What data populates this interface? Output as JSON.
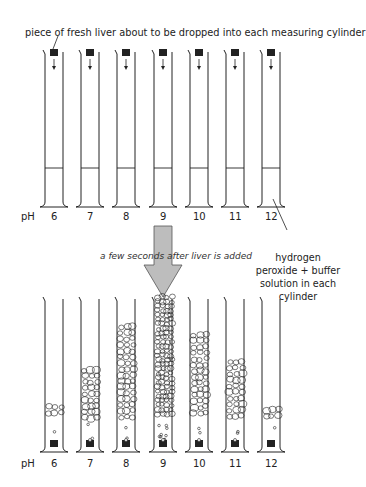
{
  "title": "piece of fresh liver about to be dropped into each measuring cylinder",
  "transition_caption": "a few seconds after liver is added",
  "solution_note": "hydrogen peroxide + buffer solution in each cylinder",
  "ph_axis_label": "pH",
  "colors": {
    "line": "#222222",
    "liver": "#222222",
    "arrow_fill": "#bdbdbd",
    "arrow_stroke": "#555555"
  },
  "cylinders": [
    {
      "ph": "6",
      "foam_top": 403
    },
    {
      "ph": "7",
      "foam_top": 366
    },
    {
      "ph": "8",
      "foam_top": 323
    },
    {
      "ph": "9",
      "foam_top": 293
    },
    {
      "ph": "10",
      "foam_top": 331
    },
    {
      "ph": "11",
      "foam_top": 358
    },
    {
      "ph": "12",
      "foam_top": 406
    }
  ]
}
